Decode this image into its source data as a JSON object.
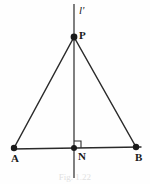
{
  "figure": {
    "type": "geometry-diagram",
    "background_color": "#fefefe",
    "stroke_color": "#2a2a2a",
    "label_color": "#1a1a1a",
    "width": 150,
    "height": 184,
    "points": [
      {
        "id": "P",
        "label": "P",
        "x": 74,
        "y": 37,
        "label_x": 79,
        "label_y": 30,
        "style": "filled-dot",
        "radius": 3.4
      },
      {
        "id": "A",
        "label": "A",
        "x": 14,
        "y": 148,
        "label_x": 11,
        "label_y": 153,
        "style": "filled-dot",
        "radius": 3.2
      },
      {
        "id": "B",
        "label": "B",
        "x": 136,
        "y": 147,
        "label_x": 135,
        "label_y": 152,
        "style": "filled-dot",
        "radius": 3.2
      },
      {
        "id": "N",
        "label": "N",
        "x": 74,
        "y": 148,
        "label_x": 78,
        "label_y": 151,
        "style": "filled-dot",
        "radius": 3.0
      }
    ],
    "lines": [
      {
        "id": "line-l-prime",
        "label": "l'",
        "x1": 74,
        "y1": 4,
        "x2": 74,
        "y2": 178,
        "width": 1.2,
        "label_x": 79,
        "label_y": 5
      },
      {
        "id": "segment-AB",
        "x1": 12,
        "y1": 149,
        "x2": 141,
        "y2": 147,
        "width": 1.4
      },
      {
        "id": "segment-PA",
        "x1": 74,
        "y1": 37,
        "x2": 14,
        "y2": 148,
        "width": 1.4
      },
      {
        "id": "segment-PB",
        "x1": 74,
        "y1": 37,
        "x2": 136,
        "y2": 147,
        "width": 1.4
      }
    ],
    "right_angle": {
      "id": "right-angle-at-N",
      "vertex_x": 74,
      "vertex_y": 148,
      "size": 7,
      "opens": "up-right",
      "width": 1.1
    },
    "caption": "Fig. 1.22"
  }
}
